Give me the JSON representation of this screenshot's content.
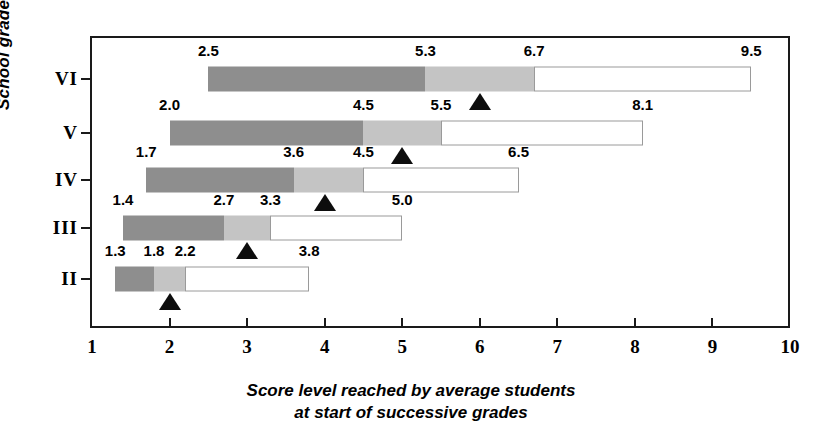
{
  "chart_data": {
    "type": "bar",
    "title": "",
    "xlabel": "Score level reached by average students at start of successive grades",
    "xlabel_line1": "Score level reached by average students",
    "xlabel_line2": "at start of successive grades",
    "ylabel": "School grade",
    "xlim": [
      1,
      10
    ],
    "x_ticks": [
      "1",
      "2",
      "3",
      "4",
      "5",
      "6",
      "7",
      "8",
      "9",
      "10"
    ],
    "x_tick_values": [
      1,
      2,
      3,
      4,
      5,
      6,
      7,
      8,
      9,
      10
    ],
    "grid": false,
    "legend": "none",
    "categories": [
      "VI",
      "V",
      "IV",
      "III",
      "II"
    ],
    "series": [
      {
        "name": "segment-dark-start",
        "values": [
          2.5,
          2.0,
          1.7,
          1.4,
          1.3
        ]
      },
      {
        "name": "segment-dark-end",
        "values": [
          5.3,
          4.5,
          3.6,
          2.7,
          1.8
        ]
      },
      {
        "name": "segment-mid-end",
        "values": [
          6.7,
          5.5,
          4.5,
          3.3,
          2.2
        ]
      },
      {
        "name": "segment-light-end",
        "values": [
          9.5,
          8.1,
          6.5,
          5.0,
          3.8
        ]
      },
      {
        "name": "average-marker",
        "values": [
          6,
          5,
          4,
          3,
          2
        ]
      }
    ],
    "rows": [
      {
        "grade": "VI",
        "y": 79,
        "start": 2.5,
        "dark_end": 5.3,
        "mid_end": 6.7,
        "end": 9.5,
        "marker": 6,
        "labels": [
          {
            "text": "2.5",
            "value": 2.5
          },
          {
            "text": "5.3",
            "value": 5.3
          },
          {
            "text": "6.7",
            "value": 6.7
          },
          {
            "text": "9.5",
            "value": 9.5
          }
        ]
      },
      {
        "grade": "V",
        "y": 133,
        "start": 2.0,
        "dark_end": 4.5,
        "mid_end": 5.5,
        "end": 8.1,
        "marker": 5,
        "labels": [
          {
            "text": "2.0",
            "value": 2.0
          },
          {
            "text": "4.5",
            "value": 4.5
          },
          {
            "text": "5.5",
            "value": 5.5
          },
          {
            "text": "8.1",
            "value": 8.1
          }
        ]
      },
      {
        "grade": "IV",
        "y": 180,
        "start": 1.7,
        "dark_end": 3.6,
        "mid_end": 4.5,
        "end": 6.5,
        "marker": 4,
        "labels": [
          {
            "text": "1.7",
            "value": 1.7
          },
          {
            "text": "3.6",
            "value": 3.6
          },
          {
            "text": "4.5",
            "value": 4.5
          },
          {
            "text": "6.5",
            "value": 6.5
          }
        ]
      },
      {
        "grade": "III",
        "y": 228,
        "start": 1.4,
        "dark_end": 2.7,
        "mid_end": 3.3,
        "end": 5.0,
        "marker": 3,
        "labels": [
          {
            "text": "1.4",
            "value": 1.4
          },
          {
            "text": "2.7",
            "value": 2.7
          },
          {
            "text": "3.3",
            "value": 3.3
          },
          {
            "text": "5.0",
            "value": 5.0
          }
        ]
      },
      {
        "grade": "II",
        "y": 279,
        "start": 1.3,
        "dark_end": 1.8,
        "mid_end": 2.2,
        "end": 3.8,
        "marker": 2,
        "labels": [
          {
            "text": "1.3",
            "value": 1.3
          },
          {
            "text": "1.8",
            "value": 1.8
          },
          {
            "text": "2.2",
            "value": 2.2
          },
          {
            "text": "3.8",
            "value": 3.8
          }
        ]
      }
    ],
    "colors": {
      "segment_dark": "#8e8e8e",
      "segment_mid": "#c4c4c4",
      "segment_light": "#ffffff",
      "segment_light_border": "#9a9a9a",
      "axis": "#1a1a1a",
      "marker": "#0d0d0d",
      "background": "#ffffff"
    }
  }
}
